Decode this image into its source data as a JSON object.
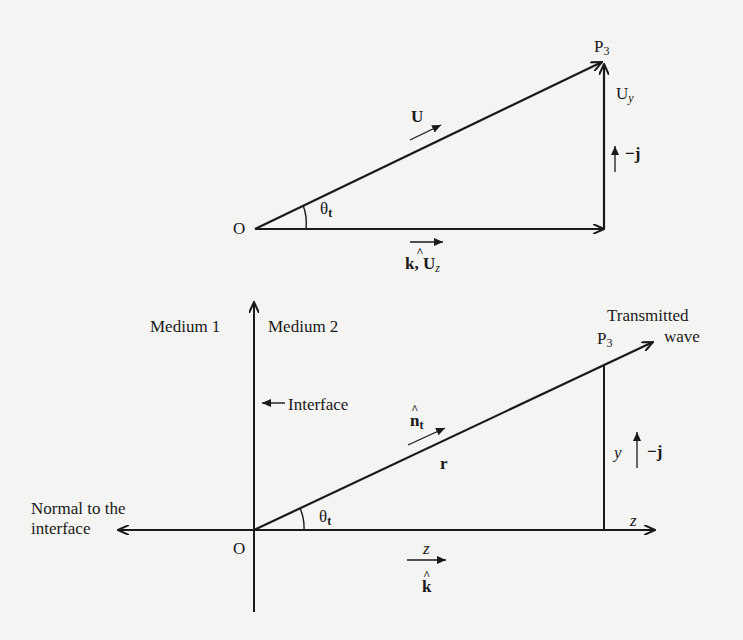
{
  "top_diagram": {
    "origin_label": "O",
    "point_label": "P",
    "point_sub": "3",
    "hypotenuse_label": "U",
    "vertical_label": "U",
    "vertical_sub": "y",
    "vertical_unit_label": "−j",
    "horizontal_unit_label": "k, U",
    "horizontal_sub": "z",
    "angle_label": "θ",
    "angle_sub": "t"
  },
  "bottom_diagram": {
    "medium1_label": "Medium 1",
    "medium2_label": "Medium 2",
    "interface_label": "Interface",
    "transmitted_line1": "Transmitted",
    "transmitted_line2": "wave",
    "point_label": "P",
    "point_sub": "3",
    "unit_normal_label": "n",
    "unit_normal_sub": "t",
    "position_label": "r",
    "y_label": "y",
    "y_unit_label": "−j",
    "z_axis_label": "z",
    "z_label": "z",
    "k_label": "k",
    "normal_line1": "Normal to the",
    "normal_line2": "interface",
    "origin_label": "O",
    "angle_label": "θ",
    "angle_sub": "t"
  },
  "colors": {
    "ink": "#1a1a1a",
    "paper": "#f4f4f2"
  }
}
